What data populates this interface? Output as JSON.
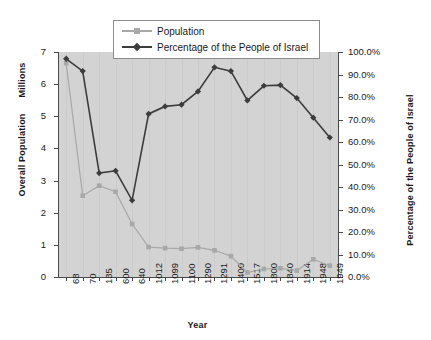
{
  "chart_data": {
    "type": "line",
    "title": "",
    "xlabel": "Year",
    "ylabel": "Overall Population",
    "ylabel_units": "Millions",
    "y2label": "Percentage of the People of Israel",
    "categories": [
      "68",
      "70",
      "135",
      "600",
      "640",
      "1012",
      "1099",
      "1100",
      "1290",
      "1291",
      "1400",
      "1517",
      "1800",
      "1840",
      "1914",
      "1948",
      "1949"
    ],
    "ylim": [
      0,
      7
    ],
    "y2lim": [
      0,
      1
    ],
    "yticks": [
      "0",
      "1",
      "2",
      "3",
      "4",
      "5",
      "6",
      "7"
    ],
    "ytick_values": [
      0,
      1,
      2,
      3,
      4,
      5,
      6,
      7
    ],
    "y2ticks": [
      "0.0%",
      "10.0%",
      "20.0%",
      "30.0%",
      "40.0%",
      "50.0%",
      "60.0%",
      "70.0%",
      "80.0%",
      "90.0%",
      "100.0%"
    ],
    "y2tick_values": [
      0,
      0.1,
      0.2,
      0.3,
      0.4,
      0.5,
      0.6,
      0.7,
      0.8,
      0.9,
      1.0
    ],
    "grid": "vertical",
    "legend_position": "top-center",
    "plot_background": "#d3d3d3",
    "series": [
      {
        "name": "Population",
        "axis": "left",
        "color": "#a8a8a8",
        "marker": "square",
        "values": [
          6.65,
          2.53,
          2.84,
          2.65,
          1.65,
          0.93,
          0.9,
          0.88,
          0.92,
          0.83,
          0.65,
          0.14,
          0.25,
          0.27,
          0.2,
          0.55,
          0.35
        ]
      },
      {
        "name": "Percentage of the People of Israel",
        "axis": "right",
        "color": "#3c3c3c",
        "marker": "diamond",
        "values": [
          0.97,
          0.915,
          0.462,
          0.472,
          0.341,
          0.725,
          0.758,
          0.766,
          0.825,
          0.932,
          0.915,
          0.785,
          0.85,
          0.853,
          0.795,
          0.708,
          0.62
        ]
      }
    ]
  },
  "legend": {
    "items": [
      {
        "label": "Population"
      },
      {
        "label": "Percentage of the People of Israel"
      }
    ]
  }
}
